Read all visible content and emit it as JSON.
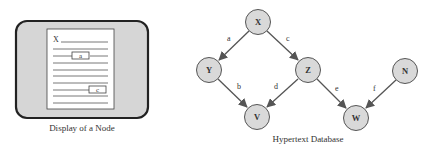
{
  "left_panel": {
    "caption": "Display of a Node",
    "page_title": "X",
    "anchor_a": "a",
    "anchor_c": "c"
  },
  "right_panel": {
    "caption": "Hypertext Database",
    "nodes": [
      {
        "id": "X",
        "cx": 258,
        "cy": 22
      },
      {
        "id": "Y",
        "cx": 209,
        "cy": 70
      },
      {
        "id": "Z",
        "cx": 308,
        "cy": 70
      },
      {
        "id": "V",
        "cx": 257,
        "cy": 117
      },
      {
        "id": "W",
        "cx": 356,
        "cy": 118
      },
      {
        "id": "N",
        "cx": 405,
        "cy": 71
      }
    ],
    "edges": [
      {
        "label": "a",
        "from": "X",
        "to": "Y"
      },
      {
        "label": "c",
        "from": "X",
        "to": "Z"
      },
      {
        "label": "b",
        "from": "Y",
        "to": "V"
      },
      {
        "label": "d",
        "from": "Z",
        "to": "V"
      },
      {
        "label": "e",
        "from": "Z",
        "to": "W"
      },
      {
        "label": "f",
        "from": "N",
        "to": "W"
      }
    ]
  },
  "colors": {
    "node_fill": "#d9d9d9",
    "panel_fill": "#d6d6d6",
    "stroke": "#555555"
  }
}
